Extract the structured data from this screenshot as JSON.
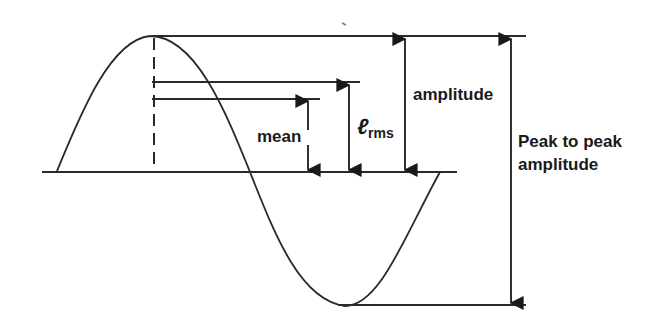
{
  "diagram": {
    "title": "",
    "waveform": "sine",
    "labels": {
      "mean": "mean",
      "rms_symbol": "ℓ",
      "rms_subscript": "rms",
      "amplitude": "amplitude",
      "peak_to_peak_line1": "Peak to peak",
      "peak_to_peak_line2": "amplitude"
    },
    "colors": {
      "stroke": "#2a2a2a",
      "background": "#ffffff"
    }
  }
}
